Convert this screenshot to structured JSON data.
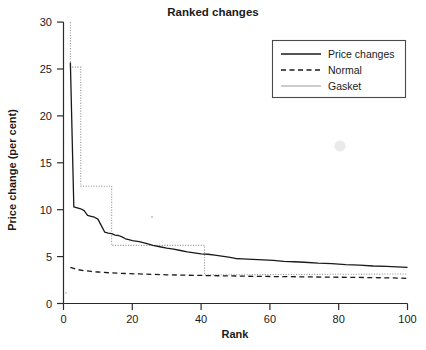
{
  "chart_data": {
    "type": "line",
    "title": "Ranked changes",
    "xlabel": "Rank",
    "ylabel": "Price change (per cent)",
    "xlim": [
      0,
      100
    ],
    "ylim": [
      0,
      30
    ],
    "xticks": [
      0,
      20,
      40,
      60,
      80,
      100
    ],
    "yticks": [
      0,
      5,
      10,
      15,
      20,
      25,
      30
    ],
    "grid": false,
    "legend_position": "top-right",
    "legend": [
      "Price changes",
      "Normal",
      "Gasket"
    ],
    "series": [
      {
        "name": "Price changes",
        "style": "solid",
        "color": "#1a1a1a",
        "x": [
          2,
          3,
          4,
          5,
          6,
          7,
          8,
          9,
          10,
          11,
          12,
          13,
          14,
          15,
          16,
          17,
          18,
          19,
          20,
          22,
          24,
          26,
          28,
          30,
          32,
          34,
          36,
          38,
          40,
          42,
          44,
          46,
          48,
          50,
          52,
          55,
          58,
          61,
          64,
          67,
          70,
          74,
          78,
          82,
          86,
          90,
          94,
          97,
          100
        ],
        "values": [
          25.7,
          10.3,
          10.2,
          10.1,
          9.9,
          9.4,
          9.3,
          9.2,
          9.0,
          8.3,
          7.6,
          7.5,
          7.45,
          7.3,
          7.25,
          7.1,
          6.9,
          6.8,
          6.7,
          6.6,
          6.4,
          6.2,
          6.05,
          5.9,
          5.8,
          5.65,
          5.5,
          5.4,
          5.3,
          5.25,
          5.15,
          5.05,
          4.95,
          4.8,
          4.75,
          4.7,
          4.65,
          4.6,
          4.5,
          4.45,
          4.4,
          4.3,
          4.25,
          4.15,
          4.1,
          4.0,
          3.95,
          3.9,
          3.85
        ]
      },
      {
        "name": "Normal",
        "style": "dashed",
        "color": "#1a1a1a",
        "x": [
          2,
          4,
          6,
          8,
          10,
          14,
          18,
          22,
          26,
          30,
          35,
          40,
          45,
          50,
          55,
          60,
          65,
          70,
          75,
          80,
          85,
          90,
          95,
          100
        ],
        "values": [
          3.85,
          3.62,
          3.5,
          3.42,
          3.36,
          3.26,
          3.2,
          3.15,
          3.1,
          3.06,
          3.02,
          2.99,
          2.96,
          2.93,
          2.9,
          2.88,
          2.86,
          2.84,
          2.82,
          2.8,
          2.78,
          2.76,
          2.73,
          2.68
        ]
      },
      {
        "name": "Gasket",
        "style": "dotted",
        "color": "#9a9a9a",
        "step": "post",
        "x": [
          2,
          2,
          4,
          4,
          5,
          5,
          13,
          13,
          14,
          14,
          40,
          41,
          41,
          100
        ],
        "values": [
          30.0,
          25.2,
          25.2,
          25.2,
          25.2,
          12.5,
          12.5,
          12.5,
          12.5,
          6.2,
          6.2,
          6.2,
          3.05,
          3.15
        ]
      }
    ],
    "annotations": []
  }
}
